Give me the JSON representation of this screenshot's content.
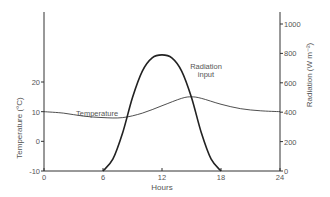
{
  "chart_data": {
    "type": "line",
    "title": "",
    "xlabel": "Hours",
    "ylabel_left": "Temperature (°C)",
    "ylabel_right": "Radiation (W m⁻²)",
    "x_ticks": [
      0,
      6,
      12,
      18,
      24
    ],
    "y_left_ticks": [
      -10,
      0,
      10,
      20
    ],
    "y_right_ticks": [
      0,
      200,
      400,
      600,
      800,
      1000
    ],
    "xlim": [
      0,
      24
    ],
    "ylim_left": [
      -10,
      20
    ],
    "ylim_right": [
      0,
      1000
    ],
    "grid": false,
    "series": [
      {
        "name": "Temperature",
        "axis": "left",
        "x": [
          0,
          2,
          4,
          6,
          8,
          10,
          12,
          14,
          15,
          16,
          18,
          20,
          22,
          24
        ],
        "values": [
          10,
          9.5,
          8.5,
          8,
          8,
          9.5,
          12,
          14.5,
          15,
          14.5,
          12.5,
          11,
          10.3,
          10
        ]
      },
      {
        "name": "Radiation input",
        "axis": "right",
        "x": [
          6,
          7,
          8,
          9,
          10,
          11,
          12,
          13,
          14,
          15,
          16,
          17,
          18
        ],
        "values": [
          0,
          80,
          260,
          500,
          680,
          770,
          790,
          770,
          680,
          500,
          260,
          80,
          0
        ]
      }
    ],
    "annotations": [
      {
        "text": "Temperature",
        "x": 3.5,
        "y_left": 10.5
      },
      {
        "text": "Radiation input",
        "x": 16.5,
        "y_right": 700
      }
    ]
  },
  "labels": {
    "x_axis": "Hours",
    "y_left": "Temperature (°C)",
    "y_right": "Radiation (W m⁻²)",
    "ann_temp": "Temperature",
    "ann_rad_1": "Radiation",
    "ann_rad_2": "input"
  }
}
